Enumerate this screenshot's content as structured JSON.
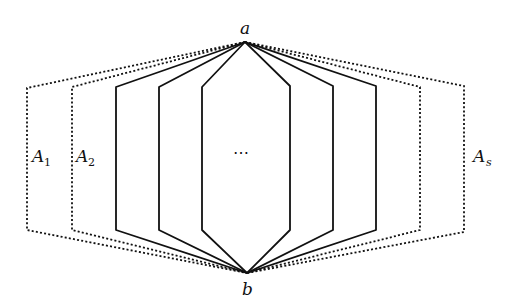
{
  "diagram": {
    "vertices": {
      "top": {
        "label": "a",
        "x": 245,
        "y": 42
      },
      "bottom": {
        "label": "b",
        "x": 247,
        "y": 273
      }
    },
    "paths": [
      {
        "name": "A1",
        "left_x": 27,
        "right_x": 464,
        "style": "dotted"
      },
      {
        "name": "A2",
        "left_x": 72,
        "right_x": 420,
        "style": "dotted"
      },
      {
        "name": "",
        "left_x": 116,
        "right_x": 376,
        "style": "solid"
      },
      {
        "name": "",
        "left_x": 159,
        "right_x": 333,
        "style": "solid"
      },
      {
        "name": "",
        "left_x": 202,
        "right_x": 290,
        "style": "solid"
      }
    ],
    "corner_y_top": 87,
    "corner_y_bottom": 230,
    "labels": {
      "a": "a",
      "b": "b",
      "A1_main": "A",
      "A1_sub": "1",
      "A2_main": "A",
      "A2_sub": "2",
      "As_main": "A",
      "As_sub": "s",
      "ellipsis": "⋯"
    },
    "stroke_color": "#111111"
  }
}
